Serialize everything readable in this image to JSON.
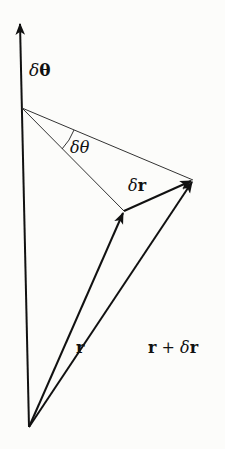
{
  "diagram": {
    "type": "vector-rotation-diagram",
    "colors": {
      "stroke": "#111111",
      "thin_stroke": "#333333",
      "background": "#fcfcfa"
    },
    "labels": {
      "axis_vector": {
        "delta": "δ",
        "symbol": "θ"
      },
      "angle": {
        "delta": "δ",
        "symbol": "θ"
      },
      "delta_r": {
        "delta": "δ",
        "symbol": "r"
      },
      "r": {
        "symbol": "r"
      },
      "r_plus_delta_r": {
        "r": "r",
        "plus": " + ",
        "delta": "δ",
        "symbol": "r"
      }
    },
    "elements": [
      "axis vector δθ (vertical arrow)",
      "vector r from origin",
      "vector r + δr from origin",
      "vector δr from tip of r to tip of r + δr",
      "thin lines from axis point to tips of r and r + δr",
      "angle arc δθ"
    ]
  }
}
